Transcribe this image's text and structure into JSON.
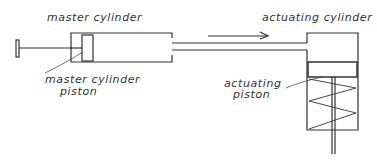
{
  "diagram": {
    "type": "hydraulic-system-schematic",
    "labels": {
      "master_cylinder": "master cylinder",
      "master_cylinder_piston_line1": "master cylinder",
      "master_cylinder_piston_line2": "piston",
      "actuating_cylinder": "actuating cylinder",
      "actuating_piston_line1": "actuating",
      "actuating_piston_line2": "piston"
    },
    "components": [
      {
        "id": "master-cylinder",
        "label": "master cylinder"
      },
      {
        "id": "master-cylinder-piston",
        "label": "master cylinder piston"
      },
      {
        "id": "push-rod",
        "label": ""
      },
      {
        "id": "pipe",
        "label": ""
      },
      {
        "id": "flow-arrow",
        "label": "",
        "direction": "right"
      },
      {
        "id": "actuating-cylinder",
        "label": "actuating cylinder"
      },
      {
        "id": "actuating-piston",
        "label": "actuating piston"
      },
      {
        "id": "return-spring",
        "label": ""
      },
      {
        "id": "piston-rod",
        "label": ""
      }
    ],
    "colors": {
      "line": "#333333",
      "background": "#ffffff"
    }
  }
}
